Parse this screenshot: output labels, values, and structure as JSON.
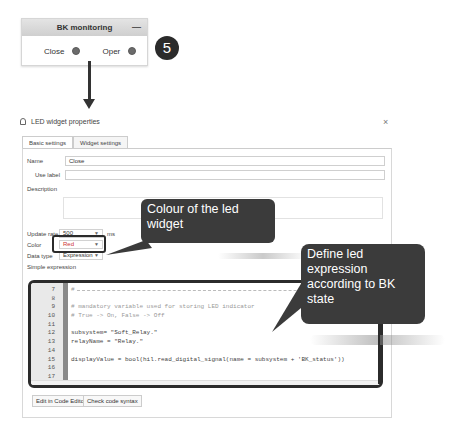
{
  "bk_widget": {
    "title": "BK monitoring",
    "minimize_icon": "—",
    "items": [
      {
        "label": "Close",
        "led_color": "#6b6b6b"
      },
      {
        "label": "Oper",
        "led_color": "#6b6b6b"
      }
    ]
  },
  "step_badge": "5",
  "dialog": {
    "title": "LED widget properties",
    "close_icon": "×",
    "tabs": [
      {
        "label": "Basic settings",
        "active": true
      },
      {
        "label": "Widget settings",
        "active": false
      }
    ],
    "fields": {
      "name_label": "Name",
      "name_value": "Close",
      "use_label_label": "Use label",
      "use_label_value": "",
      "description_label": "Description",
      "update_rate_label": "Update rate",
      "update_rate_value": "500",
      "update_rate_unit": "ms",
      "color_label": "Color",
      "color_value": "Red",
      "data_type_label": "Data type",
      "data_type_value": "Expression",
      "simple_expression_label": "Simple expression"
    },
    "code_lines": [
      {
        "n": "7",
        "text": "#",
        "type": "dash"
      },
      {
        "n": "8",
        "text": "",
        "type": "code"
      },
      {
        "n": "9",
        "text": "# mandatory variable used for storing LED indicator",
        "type": "comment"
      },
      {
        "n": "10",
        "text": "# True -> On, False -> Off",
        "type": "comment"
      },
      {
        "n": "11",
        "text": "",
        "type": "code"
      },
      {
        "n": "12",
        "text": "subsystem= \"Soft_Relay.\"",
        "type": "code"
      },
      {
        "n": "13",
        "text": "relayName = \"Relay.\"",
        "type": "code"
      },
      {
        "n": "14",
        "text": "",
        "type": "code"
      },
      {
        "n": "15",
        "text": "displayValue = bool(hil.read_digital_signal(name = subsystem + 'BK_status'))",
        "type": "code"
      },
      {
        "n": "16",
        "text": "",
        "type": "code"
      },
      {
        "n": "17",
        "text": "",
        "type": "code"
      }
    ],
    "buttons": {
      "edit_code": "Edit in Code Editor",
      "check_syntax": "Check code syntax"
    }
  },
  "callouts": {
    "color": "Colour of the led widget",
    "expression": "Define led expression according to BK state"
  },
  "colors": {
    "callout_bg": "#3b3b3b",
    "highlight_border": "#2b2b2b",
    "color_value_text": "#cc3333"
  }
}
